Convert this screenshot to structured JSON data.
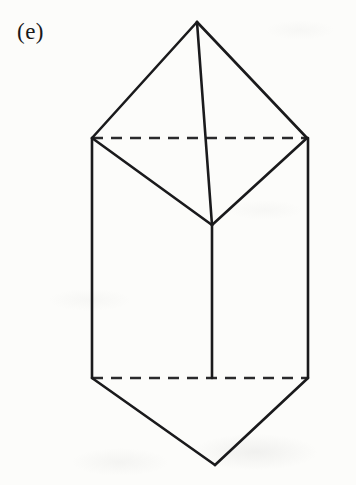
{
  "figure": {
    "panel_label": "(e)",
    "caption": "",
    "shape_name": "triangular-bipyramid-prism",
    "stroke_color": "#1a1a1c",
    "background_color": "#fcfcfa",
    "dash_color": "#2a2a2c",
    "solid_stroke_width": 2.6,
    "dashed_stroke_width": 2.4,
    "dash_pattern": "11 8",
    "vertices": {
      "apex_top": [
        197,
        22
      ],
      "left_rim": [
        92,
        138
      ],
      "right_rim": [
        307,
        138
      ],
      "front_rim": [
        212,
        225
      ],
      "left_base": [
        92,
        378
      ],
      "right_base": [
        308,
        378
      ],
      "front_base": [
        212,
        378
      ],
      "apex_bottom": [
        215,
        465
      ]
    },
    "solid_edges": [
      {
        "name": "apex-to-left-rim",
        "from": [
          197,
          22
        ],
        "to": [
          92,
          138
        ]
      },
      {
        "name": "apex-to-right-rim",
        "from": [
          197,
          22
        ],
        "to": [
          307,
          138
        ]
      },
      {
        "name": "apex-to-front-rim",
        "from": [
          197,
          22
        ],
        "to": [
          212,
          225
        ]
      },
      {
        "name": "left-rim-to-front-rim",
        "from": [
          92,
          138
        ],
        "to": [
          212,
          225
        ]
      },
      {
        "name": "right-rim-to-front-rim",
        "from": [
          307,
          138
        ],
        "to": [
          212,
          225
        ]
      },
      {
        "name": "left-vertical-edge",
        "from": [
          92,
          138
        ],
        "to": [
          92,
          378
        ]
      },
      {
        "name": "right-vertical-edge",
        "from": [
          308,
          138
        ],
        "to": [
          308,
          378
        ]
      },
      {
        "name": "front-vertical-edge",
        "from": [
          212,
          225
        ],
        "to": [
          212,
          378
        ]
      },
      {
        "name": "left-base-to-bottom-apex",
        "from": [
          92,
          378
        ],
        "to": [
          215,
          465
        ]
      },
      {
        "name": "right-base-to-bottom-apex",
        "from": [
          308,
          378
        ],
        "to": [
          215,
          465
        ]
      }
    ],
    "dashed_edges": [
      {
        "name": "top-hidden-rim-edge",
        "from": [
          92,
          138
        ],
        "to": [
          307,
          138
        ]
      },
      {
        "name": "bottom-hidden-base-edge",
        "from": [
          92,
          378
        ],
        "to": [
          308,
          378
        ]
      }
    ]
  }
}
